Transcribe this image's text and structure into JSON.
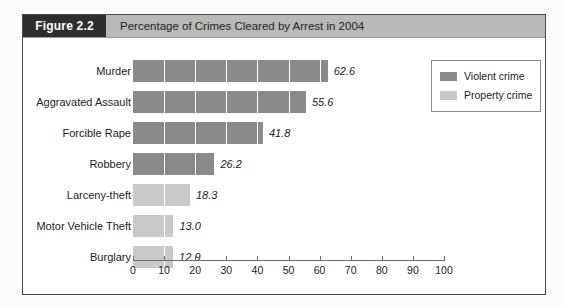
{
  "figure": {
    "tag": "Figure 2.2",
    "caption": "Percentage of Crimes Cleared by Arrest in 2004"
  },
  "legend": {
    "items": [
      {
        "label": "Violent crime",
        "color": "#8a8a8a"
      },
      {
        "label": "Property crime",
        "color": "#c9c9c9"
      }
    ]
  },
  "chart_data": {
    "type": "bar",
    "orientation": "horizontal",
    "title": "Percentage of Crimes Cleared by Arrest in 2004",
    "xlabel": "",
    "ylabel": "",
    "xlim": [
      0,
      100
    ],
    "xticks": [
      "0",
      "10",
      "20",
      "30",
      "40",
      "50",
      "60",
      "70",
      "80",
      "90",
      "100"
    ],
    "grid": true,
    "legend_position": "top-right",
    "categories": [
      "Murder",
      "Aggravated Assault",
      "Forcible Rape",
      "Robbery",
      "Larceny-theft",
      "Motor Vehicle Theft",
      "Burglary"
    ],
    "values": [
      62.6,
      55.6,
      41.8,
      26.2,
      18.3,
      13.0,
      12.9
    ],
    "value_labels": [
      "62.6",
      "55.6",
      "41.8",
      "26.2",
      "18.3",
      "13.0",
      "12.9"
    ],
    "groups": [
      "Violent crime",
      "Violent crime",
      "Violent crime",
      "Violent crime",
      "Property crime",
      "Property crime",
      "Property crime"
    ]
  }
}
